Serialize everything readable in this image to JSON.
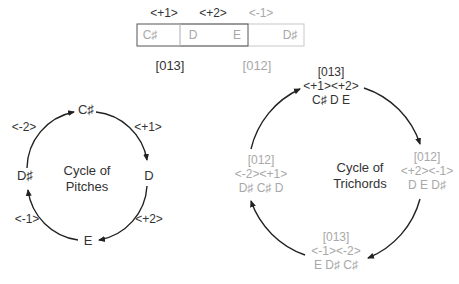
{
  "top": {
    "intervals": [
      {
        "label": "<+1>",
        "shade": "dark"
      },
      {
        "label": "<+2>",
        "shade": "dark"
      },
      {
        "label": "<-1>",
        "shade": "light"
      }
    ],
    "notes": [
      "C♯",
      "D",
      "E",
      "D♯"
    ],
    "set_classes": [
      {
        "label": "[013]",
        "shade": "dark"
      },
      {
        "label": "[012]",
        "shade": "light"
      }
    ]
  },
  "cycle_of_pitches": {
    "title_line1": "Cycle of",
    "title_line2": "Pitches",
    "nodes": [
      "C♯",
      "D",
      "E",
      "D♯"
    ],
    "intervals": [
      "<+1>",
      "<+2>",
      "<-1>",
      "<-2>"
    ]
  },
  "cycle_of_trichords": {
    "title_line1": "Cycle of",
    "title_line2": "Trichords",
    "nodes": [
      {
        "set_class": "[013]",
        "intervals": "<+1><+2>",
        "pitches": "C♯ D E",
        "shade": "dark"
      },
      {
        "set_class": "[012]",
        "intervals": "<+2><-1>",
        "pitches": "D E D♯",
        "shade": "light"
      },
      {
        "set_class": "[013]",
        "intervals": "<-1><-2>",
        "pitches": "E D♯ C♯",
        "shade": "light"
      },
      {
        "set_class": "[012]",
        "intervals": "<-2><+1>",
        "pitches": "D♯ C♯ D",
        "shade": "light"
      }
    ]
  },
  "colors": {
    "dark": "#333333",
    "light": "#a8a8a8",
    "box_dark": "#555555",
    "box_light": "#c8c8c8"
  }
}
